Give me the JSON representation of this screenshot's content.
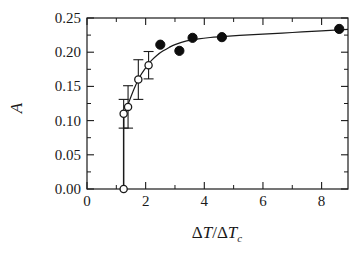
{
  "chart_data": {
    "type": "scatter",
    "title": "",
    "xlabel": "ΔT/ΔT_c",
    "ylabel": "A",
    "xlim": [
      0,
      8.9
    ],
    "ylim": [
      0.0,
      0.25
    ],
    "grid": false,
    "legend": "none",
    "x_ticks": [
      0,
      2,
      4,
      6,
      8
    ],
    "x_tick_labels": [
      "0",
      "2",
      "4",
      "6",
      "8"
    ],
    "x_minor_ticks": [
      1,
      3,
      5,
      7
    ],
    "y_ticks": [
      0.0,
      0.05,
      0.1,
      0.15,
      0.2,
      0.25
    ],
    "y_tick_labels": [
      "0.00",
      "0.05",
      "0.10",
      "0.15",
      "0.20",
      "0.25"
    ],
    "y_minor_ticks": [
      0.025,
      0.075,
      0.125,
      0.175,
      0.225
    ],
    "series": [
      {
        "name": "open-circles-with-error-bars",
        "marker": "open-circle",
        "points": [
          {
            "x": 1.25,
            "y": 0.0,
            "yerr": 0.0
          },
          {
            "x": 1.25,
            "y": 0.11,
            "yerr": 0.021
          },
          {
            "x": 1.4,
            "y": 0.12,
            "yerr": 0.031
          },
          {
            "x": 1.75,
            "y": 0.16,
            "yerr": 0.029
          },
          {
            "x": 2.1,
            "y": 0.181,
            "yerr": 0.02
          }
        ]
      },
      {
        "name": "filled-circles",
        "marker": "filled-circle",
        "points": [
          {
            "x": 2.5,
            "y": 0.211
          },
          {
            "x": 3.15,
            "y": 0.202
          },
          {
            "x": 3.6,
            "y": 0.221
          },
          {
            "x": 4.6,
            "y": 0.222
          },
          {
            "x": 8.6,
            "y": 0.234
          }
        ]
      }
    ],
    "fit_curve": {
      "name": "model-fit",
      "points": [
        {
          "x": 1.25,
          "y": 0.108
        },
        {
          "x": 1.4,
          "y": 0.124
        },
        {
          "x": 1.6,
          "y": 0.146
        },
        {
          "x": 1.8,
          "y": 0.164
        },
        {
          "x": 2.0,
          "y": 0.177
        },
        {
          "x": 2.2,
          "y": 0.188
        },
        {
          "x": 2.4,
          "y": 0.196
        },
        {
          "x": 2.6,
          "y": 0.202
        },
        {
          "x": 2.8,
          "y": 0.207
        },
        {
          "x": 3.0,
          "y": 0.211
        },
        {
          "x": 3.4,
          "y": 0.2165
        },
        {
          "x": 3.8,
          "y": 0.2195
        },
        {
          "x": 4.2,
          "y": 0.2215
        },
        {
          "x": 4.6,
          "y": 0.2228
        },
        {
          "x": 5.2,
          "y": 0.2245
        },
        {
          "x": 6.0,
          "y": 0.2265
        },
        {
          "x": 7.0,
          "y": 0.2288
        },
        {
          "x": 8.0,
          "y": 0.2312
        },
        {
          "x": 8.9,
          "y": 0.2335
        }
      ]
    },
    "vertical_jump": {
      "x": 1.25,
      "y_from": 0.0,
      "y_to": 0.108
    },
    "colors": {
      "ink": "#1a1a1a",
      "marker_fill": "#0d0d0d",
      "background": "#ffffff"
    }
  }
}
